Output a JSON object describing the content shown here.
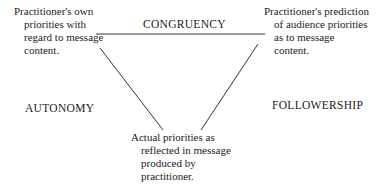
{
  "diagram": {
    "nodes": {
      "top_left": {
        "lines": [
          "Practitioner's own",
          "priorities with",
          "regard to message",
          "content."
        ]
      },
      "top_right": {
        "lines": [
          "Practitioner's prediction",
          "of audience priorities",
          "as to message",
          "content."
        ]
      },
      "bottom": {
        "lines": [
          "Actual priorities as",
          "reflected in message",
          "produced by",
          "practitioner."
        ]
      }
    },
    "edges": {
      "top": "CONGRUENCY",
      "left": "AUTONOMY",
      "right": "FOLLOWERSHIP"
    }
  }
}
